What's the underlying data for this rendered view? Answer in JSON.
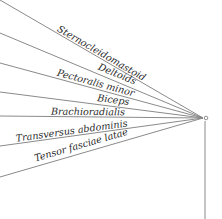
{
  "diagram": {
    "title": "",
    "hub": {
      "x": 203,
      "y": 118,
      "marker_x": 206,
      "marker_y": 118
    },
    "vertical_line": {
      "x": 205,
      "y1": 121,
      "y2": 219
    },
    "lines": [
      {
        "label": "Sternocleidomastoid",
        "y0": 0,
        "label_x": 100,
        "label_y": 56
      },
      {
        "label": "Deltoids",
        "y0": 33,
        "label_x": 116,
        "label_y": 77
      },
      {
        "label": "Pectoralis minor",
        "y0": 63,
        "label_x": 95,
        "label_y": 86
      },
      {
        "label": "Biceps",
        "y0": 92,
        "label_x": 113,
        "label_y": 103
      },
      {
        "label": "Brachioradialis",
        "y0": 116,
        "label_x": 88,
        "label_y": 115
      },
      {
        "label": "Transversus abdominis",
        "y0": 146,
        "label_x": 72,
        "label_y": 134
      },
      {
        "label": "Tensor fasciae latae",
        "y0": 177,
        "label_x": 82,
        "label_y": 148
      }
    ]
  }
}
